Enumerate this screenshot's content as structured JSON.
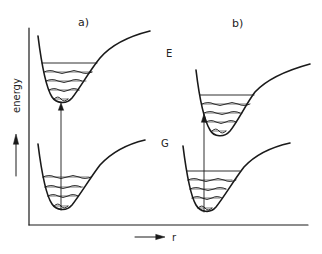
{
  "figure": {
    "panel_a_label": "a)",
    "panel_b_label": "b)",
    "excited_state_label": "E",
    "ground_state_label": "G",
    "y_axis_label": "energy",
    "x_axis_label": "r",
    "line_color": "#1a1a1a"
  },
  "panels": [
    {
      "id": "a",
      "label": "a)",
      "description": "Vertical transition from ground-state minimum to excited-state minimum (undisplaced potentials)",
      "curves": [
        "G",
        "E"
      ]
    },
    {
      "id": "b",
      "label": "b)",
      "description": "Vertical transition to displaced excited-state potential, landing on its left wall",
      "curves": [
        "G",
        "E"
      ]
    }
  ]
}
